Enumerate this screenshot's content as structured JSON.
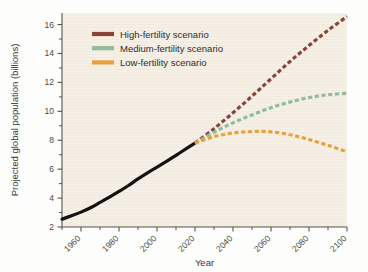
{
  "figure": {
    "background_color": "#fdfdfb",
    "plot_background_color": "#f5efe5",
    "axis_color": "#55544f"
  },
  "chart_data": {
    "type": "line",
    "title": "",
    "xlabel": "Year",
    "ylabel": "Projected global population (billions)",
    "xlim": [
      1950,
      2100
    ],
    "ylim": [
      2,
      16.8
    ],
    "grid": false,
    "legend_position": "top-left-inside",
    "x_major_ticks": [
      1960,
      1980,
      2000,
      2020,
      2040,
      2060,
      2080,
      2100
    ],
    "x_major_tick_labels": [
      "1960",
      "1980",
      "2000",
      "2020",
      "2040",
      "2060",
      "2080",
      "2100"
    ],
    "x_minor_ticks": [
      1950,
      1970,
      1990,
      2010,
      2030,
      2050,
      2070,
      2090
    ],
    "y_major_ticks": [
      2,
      4,
      6,
      8,
      10,
      12,
      14,
      16
    ],
    "y_major_tick_labels": [
      "2",
      "4",
      "6",
      "8",
      "10",
      "12",
      "14",
      "16"
    ],
    "y_minor_ticks": [
      3,
      5,
      7,
      9,
      11,
      13,
      15
    ],
    "x_tick_label_rotation": -45,
    "series": [
      {
        "name": "Historical population",
        "color": "#151311",
        "style": "solid",
        "width": 3.2,
        "in_legend": false,
        "x": [
          1950,
          1955,
          1960,
          1965,
          1970,
          1975,
          1980,
          1985,
          1990,
          1995,
          2000,
          2005,
          2010,
          2015,
          2020
        ],
        "values": [
          2.54,
          2.77,
          3.03,
          3.33,
          3.7,
          4.07,
          4.46,
          4.87,
          5.33,
          5.75,
          6.14,
          6.54,
          6.96,
          7.38,
          7.8
        ]
      },
      {
        "name": "High-fertility scenario",
        "color": "#8b4338",
        "style": "dashed",
        "width": 3.2,
        "in_legend": true,
        "x": [
          2020,
          2030,
          2040,
          2050,
          2060,
          2070,
          2080,
          2090,
          2100
        ],
        "values": [
          7.8,
          8.8,
          9.9,
          11.05,
          12.25,
          13.45,
          14.55,
          15.6,
          16.55
        ]
      },
      {
        "name": "Medium-fertility scenario",
        "color": "#8fbc9a",
        "style": "dashed",
        "width": 3.2,
        "in_legend": true,
        "x": [
          2020,
          2030,
          2040,
          2050,
          2060,
          2070,
          2080,
          2090,
          2100
        ],
        "values": [
          7.8,
          8.55,
          9.2,
          9.75,
          10.25,
          10.65,
          10.95,
          11.15,
          11.25
        ]
      },
      {
        "name": "Low-fertility scenario",
        "color": "#e8a13c",
        "style": "dashed",
        "width": 3.2,
        "in_legend": true,
        "x": [
          2020,
          2030,
          2040,
          2050,
          2060,
          2070,
          2080,
          2090,
          2100
        ],
        "values": [
          7.8,
          8.25,
          8.5,
          8.6,
          8.58,
          8.38,
          8.05,
          7.65,
          7.2
        ]
      }
    ],
    "legend_entries": [
      {
        "label": "High-fertility scenario",
        "color": "#8b4338"
      },
      {
        "label": "Medium-fertility scenario",
        "color": "#8fbc9a"
      },
      {
        "label": "Low-fertility scenario",
        "color": "#e8a13c"
      }
    ]
  }
}
